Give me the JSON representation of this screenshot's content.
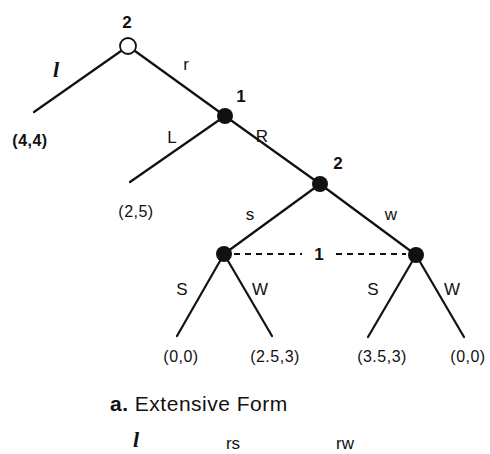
{
  "diagram": {
    "type": "game-tree-extensive-form",
    "caption": {
      "prefix": "a.",
      "text": "Extensive Form"
    },
    "nodes": [
      {
        "id": "root",
        "player": "2",
        "kind": "open",
        "x": 128,
        "y": 46,
        "label_x": 127,
        "label_y": 22
      },
      {
        "id": "n1",
        "player": "1",
        "kind": "filled",
        "x": 225,
        "y": 116,
        "label_x": 241,
        "label_y": 96
      },
      {
        "id": "n2",
        "player": "2",
        "kind": "filled",
        "x": 320,
        "y": 184,
        "label_x": 338,
        "label_y": 163
      },
      {
        "id": "n3",
        "player": "1",
        "kind": "filled",
        "x": 224,
        "y": 254
      },
      {
        "id": "n4",
        "player": "1",
        "kind": "filled",
        "x": 416,
        "y": 255
      }
    ],
    "edges": [
      {
        "from": "root",
        "to_x": 34,
        "to_y": 112,
        "action": "l",
        "label_x": 56,
        "label_y": 70,
        "italic": true
      },
      {
        "from": "root",
        "to": "n1",
        "action": "r",
        "label_x": 186,
        "label_y": 64
      },
      {
        "from": "n1",
        "to_x": 130,
        "to_y": 182,
        "action": "L",
        "label_x": 172,
        "label_y": 137
      },
      {
        "from": "n1",
        "to": "n2",
        "action": "R",
        "label_x": 262,
        "label_y": 136
      },
      {
        "from": "n2",
        "to": "n3",
        "action": "s",
        "label_x": 250,
        "label_y": 214
      },
      {
        "from": "n2",
        "to": "n4",
        "action": "w",
        "label_x": 391,
        "label_y": 214
      },
      {
        "from": "n3",
        "to_x": 177,
        "to_y": 336,
        "action": "S",
        "label_x": 182,
        "label_y": 289
      },
      {
        "from": "n3",
        "to_x": 272,
        "to_y": 336,
        "action": "W",
        "label_x": 260,
        "label_y": 289
      },
      {
        "from": "n4",
        "to_x": 368,
        "to_y": 337,
        "action": "S",
        "label_x": 373,
        "label_y": 289
      },
      {
        "from": "n4",
        "to_x": 464,
        "to_y": 337,
        "action": "W",
        "label_x": 452,
        "label_y": 289
      }
    ],
    "information_set": {
      "player": "1",
      "nodes": [
        "n3",
        "n4"
      ],
      "label_x": 319,
      "label_y": 254
    },
    "payoffs": [
      {
        "text": "(4,4)",
        "x": 30,
        "y": 141,
        "bold": true
      },
      {
        "text": "(2,5)",
        "x": 136,
        "y": 212,
        "bold": false
      },
      {
        "text": "(0,0)",
        "x": 181,
        "y": 357,
        "bold": false
      },
      {
        "text": "(2.5,3)",
        "x": 275,
        "y": 357,
        "bold": false
      },
      {
        "text": "(3.5,3)",
        "x": 382,
        "y": 357,
        "bold": false
      },
      {
        "text": "(0,0)",
        "x": 468,
        "y": 357,
        "bold": false
      }
    ],
    "strategy_row": [
      {
        "text": "l",
        "x": 136,
        "y": 440,
        "italic": true
      },
      {
        "text": "rs",
        "x": 233,
        "y": 443,
        "italic": false
      },
      {
        "text": "rw",
        "x": 345,
        "y": 443,
        "italic": false
      }
    ],
    "colors": {
      "ink": "#111111",
      "background": "#ffffff"
    }
  },
  "labels": {
    "root_player": "2",
    "n1_player": "1",
    "n2_player": "2",
    "info_set_player": "1",
    "action_l": "l",
    "action_r": "r",
    "action_L": "L",
    "action_R": "R",
    "action_s": "s",
    "action_w": "w",
    "action_S_left": "S",
    "action_W_left": "W",
    "action_S_right": "S",
    "action_W_right": "W",
    "payoff_l": "(4,4)",
    "payoff_L": "(2,5)",
    "payoff_sS": "(0,0)",
    "payoff_sW": "(2.5,3)",
    "payoff_wS": "(3.5,3)",
    "payoff_wW": "(0,0)",
    "caption_prefix": "a.",
    "caption_text": "Extensive Form",
    "strategy_l": "l",
    "strategy_rs": "rs",
    "strategy_rw": "rw"
  }
}
